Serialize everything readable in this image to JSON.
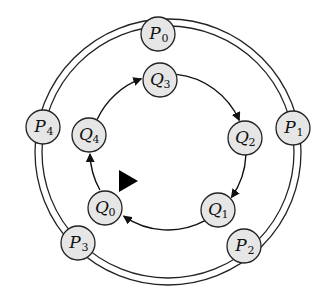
{
  "diagram": {
    "type": "ring-overlay",
    "colors": {
      "node_fill": "#e6e6e6",
      "stroke": "#222222",
      "background": "#ffffff"
    },
    "outer_ring": {
      "style": "double-line",
      "center": [
        168,
        152
      ],
      "radius_outer": 133,
      "radius_inner": 126,
      "nodes": [
        {
          "id": "P0",
          "letter": "P",
          "sub": "0",
          "x": 158,
          "y": 34
        },
        {
          "id": "P1",
          "letter": "P",
          "sub": "1",
          "x": 293,
          "y": 128
        },
        {
          "id": "P2",
          "letter": "P",
          "sub": "2",
          "x": 244,
          "y": 246
        },
        {
          "id": "P3",
          "letter": "P",
          "sub": "3",
          "x": 78,
          "y": 243
        },
        {
          "id": "P4",
          "letter": "P",
          "sub": "4",
          "x": 43,
          "y": 127
        }
      ]
    },
    "inner_ring": {
      "style": "directed-cycle",
      "center": [
        168,
        152
      ],
      "radius": 78,
      "nodes": [
        {
          "id": "Q0",
          "letter": "Q",
          "sub": "0",
          "x": 105,
          "y": 208
        },
        {
          "id": "Q1",
          "letter": "Q",
          "sub": "1",
          "x": 218,
          "y": 210
        },
        {
          "id": "Q2",
          "letter": "Q",
          "sub": "2",
          "x": 245,
          "y": 138
        },
        {
          "id": "Q3",
          "letter": "Q",
          "sub": "3",
          "x": 160,
          "y": 80
        },
        {
          "id": "Q4",
          "letter": "Q",
          "sub": "4",
          "x": 89,
          "y": 135
        }
      ],
      "edges": [
        {
          "from": "Q0",
          "to": "Q4"
        },
        {
          "from": "Q4",
          "to": "Q3"
        },
        {
          "from": "Q3",
          "to": "Q2"
        },
        {
          "from": "Q2",
          "to": "Q1"
        },
        {
          "from": "Q1",
          "to": "Q0"
        }
      ]
    },
    "pointer": {
      "shape": "filled-triangle",
      "direction": "right",
      "points": "119,170 138,181 119,192"
    }
  }
}
